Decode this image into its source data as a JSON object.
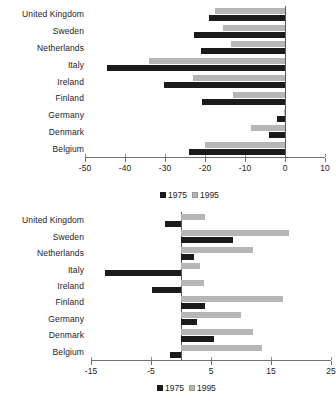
{
  "chart_data": [
    {
      "id": "top",
      "type": "bar",
      "orientation": "horizontal",
      "title": "",
      "xlabel": "",
      "ylabel": "",
      "grid": false,
      "legend_position": "bottom",
      "xlim": [
        -50,
        10
      ],
      "xticks": [
        -50,
        -40,
        -30,
        -20,
        -10,
        0,
        10
      ],
      "xtick_labels": [
        "-50",
        "-40",
        "-30",
        "-20",
        "-10",
        "0",
        "10"
      ],
      "categories": [
        "United Kingdom",
        "Sweden",
        "Netherlands",
        "Italy",
        "Ireland",
        "Finland",
        "Germany",
        "Denmark",
        "Belgium"
      ],
      "series": [
        {
          "name": "1975",
          "color": "#1b1b1b",
          "values": [
            -19.0,
            -22.7,
            -21.0,
            -44.5,
            -30.3,
            -20.7,
            -2.0,
            -4.0,
            -24.0
          ]
        },
        {
          "name": "1995",
          "color": "#b6b6b6",
          "values": [
            -17.5,
            -15.5,
            -13.5,
            -34.0,
            -23.0,
            -13.0,
            -0.3,
            -8.5,
            -20.0
          ]
        }
      ]
    },
    {
      "id": "bottom",
      "type": "bar",
      "orientation": "horizontal",
      "title": "",
      "xlabel": "",
      "ylabel": "",
      "grid": false,
      "legend_position": "both",
      "xlim": [
        -15,
        25
      ],
      "xticks": [
        -15,
        -5,
        5,
        15,
        25
      ],
      "xtick_labels": [
        "-15",
        "-5",
        "5",
        "15",
        "25"
      ],
      "categories": [
        "United Kingdom",
        "Sweden",
        "Netherlands",
        "Italy",
        "Ireland",
        "Finland",
        "Germany",
        "Denmark",
        "Belgium"
      ],
      "series": [
        {
          "name": "1975",
          "color": "#1b1b1b",
          "values": [
            -2.7,
            8.7,
            2.2,
            -12.7,
            -4.8,
            4.0,
            2.7,
            5.5,
            -1.8
          ]
        },
        {
          "name": "1995",
          "color": "#b6b6b6",
          "values": [
            4.0,
            18.0,
            12.0,
            3.2,
            3.8,
            17.0,
            10.0,
            12.0,
            13.5
          ]
        }
      ]
    }
  ],
  "legends": {
    "middle": [
      {
        "label": "1975",
        "color": "#1b1b1b"
      },
      {
        "label": "1995",
        "color": "#b6b6b6"
      }
    ],
    "bottom": [
      {
        "label": "1975",
        "color": "#1b1b1b"
      },
      {
        "label": "1995",
        "color": "#b6b6b6"
      }
    ]
  }
}
